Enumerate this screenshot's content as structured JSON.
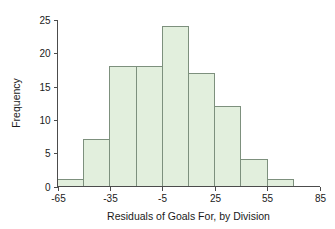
{
  "chart_data": {
    "type": "bar",
    "title": "",
    "subtitle": "",
    "xlabel": "Residuals of Goals For, by Division",
    "ylabel": "Frequency",
    "bin_width": 15,
    "bin_starts": [
      -65,
      -50,
      -35,
      -20,
      -5,
      10,
      25,
      40,
      55
    ],
    "bin_ends": [
      -50,
      -35,
      -20,
      -5,
      10,
      25,
      40,
      55,
      70
    ],
    "categories": [
      "-65 to -50",
      "-50 to -35",
      "-35 to -20",
      "-20 to -5",
      "-5 to 10",
      "10 to 25",
      "25 to 40",
      "40 to 55",
      "55 to 70"
    ],
    "values": [
      1,
      7,
      18,
      18,
      24,
      17,
      12,
      4,
      1
    ],
    "xlim": [
      -65,
      85
    ],
    "ylim": [
      0,
      25
    ],
    "xticks": [
      -65,
      -35,
      -5,
      25,
      55,
      85
    ],
    "xtick_labels": [
      "-65",
      "-35",
      "-5",
      "25",
      "55",
      "85"
    ],
    "yticks": [
      0,
      5,
      10,
      15,
      20,
      25
    ],
    "ytick_labels": [
      "0",
      "5",
      "10",
      "15",
      "20",
      "25"
    ],
    "grid": false,
    "legend": false,
    "legend_position": "none",
    "bar_fill_color": "#e2efdd",
    "bar_edge_color": "#7d907d",
    "axis_color": "#4c4c4c",
    "text_color": "#1a1a1a",
    "background_color": "#ffffff"
  }
}
